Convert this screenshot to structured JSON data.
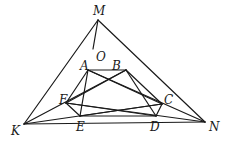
{
  "diagram": {
    "points": {
      "M": {
        "x": 98,
        "y": 20
      },
      "O": {
        "x": 93,
        "y": 49
      },
      "A": {
        "x": 88,
        "y": 70
      },
      "B": {
        "x": 126,
        "y": 70
      },
      "F": {
        "x": 66,
        "y": 103
      },
      "C": {
        "x": 162,
        "y": 104
      },
      "E": {
        "x": 80,
        "y": 116
      },
      "D": {
        "x": 156,
        "y": 116
      },
      "K": {
        "x": 24,
        "y": 124
      },
      "N": {
        "x": 205,
        "y": 122
      }
    },
    "labels": {
      "M": {
        "text": "M",
        "x": 93,
        "y": 15
      },
      "O": {
        "text": "O",
        "x": 96,
        "y": 61
      },
      "A": {
        "text": "A",
        "x": 80,
        "y": 70
      },
      "B": {
        "text": "B",
        "x": 112,
        "y": 70
      },
      "F": {
        "text": "F",
        "x": 59,
        "y": 104
      },
      "C": {
        "text": "C",
        "x": 164,
        "y": 104
      },
      "E": {
        "text": "E",
        "x": 76,
        "y": 131
      },
      "D": {
        "text": "D",
        "x": 150,
        "y": 131
      },
      "K": {
        "text": "K",
        "x": 11,
        "y": 135
      },
      "N": {
        "text": "N",
        "x": 209,
        "y": 131
      }
    },
    "segments": [
      [
        "K",
        "M"
      ],
      [
        "M",
        "N"
      ],
      [
        "K",
        "N"
      ],
      [
        "M",
        "O"
      ],
      [
        "K",
        "B"
      ],
      [
        "N",
        "A"
      ],
      [
        "A",
        "B"
      ],
      [
        "B",
        "C"
      ],
      [
        "C",
        "D"
      ],
      [
        "D",
        "E"
      ],
      [
        "E",
        "F"
      ],
      [
        "F",
        "A"
      ],
      [
        "A",
        "E"
      ],
      [
        "B",
        "D"
      ],
      [
        "A",
        "C"
      ],
      [
        "B",
        "F"
      ],
      [
        "F",
        "D"
      ],
      [
        "E",
        "C"
      ],
      [
        "K",
        "C"
      ],
      [
        "N",
        "F"
      ]
    ],
    "stroke_color": "#1a1a1a",
    "background": "#ffffff"
  }
}
